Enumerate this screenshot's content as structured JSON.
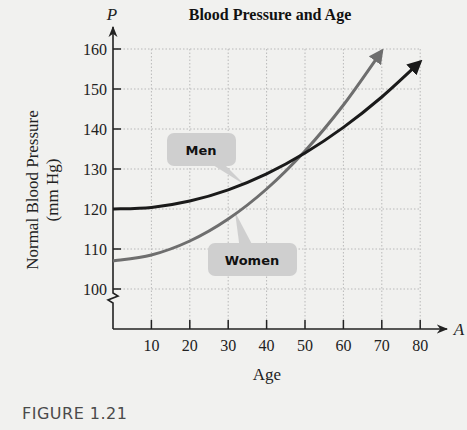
{
  "chart_data": {
    "type": "line",
    "title": "Blood Pressure and Age",
    "xlabel": "Age",
    "ylabel": "Normal Blood Pressure (mm Hg)",
    "x_axis_variable": "A",
    "y_axis_variable": "P",
    "xlim": [
      0,
      80
    ],
    "ylim": [
      100,
      160
    ],
    "y_axis_break": true,
    "grid": true,
    "x_ticks": [
      10,
      20,
      30,
      40,
      50,
      60,
      70,
      80
    ],
    "y_ticks": [
      100,
      110,
      120,
      130,
      140,
      150,
      160
    ],
    "x": [
      0,
      10,
      20,
      30,
      40,
      50,
      60,
      70,
      80
    ],
    "series": [
      {
        "name": "Men",
        "color": "#1a1a1a",
        "values": [
          120,
          120.4,
          122,
          124.8,
          128.8,
          134,
          140.4,
          148,
          156.8
        ]
      },
      {
        "name": "Women",
        "color": "#6e6e6e",
        "values": [
          107,
          108.5,
          112,
          117.5,
          125,
          134.5,
          146,
          159.5,
          null
        ]
      }
    ],
    "annotations": [
      {
        "text": "Men",
        "points_to": "Men curve near A=30"
      },
      {
        "text": "Women",
        "points_to": "Women curve near A=35"
      }
    ],
    "legend_position": "callouts"
  },
  "figure": {
    "caption": "FIGURE 1.21"
  },
  "labels": {
    "title": "Blood Pressure and Age",
    "y_var": "P",
    "x_var": "A",
    "x_label": "Age",
    "y_label_line1": "Normal Blood Pressure",
    "y_label_line2": "(mm Hg)",
    "men": "Men",
    "women": "Women"
  }
}
